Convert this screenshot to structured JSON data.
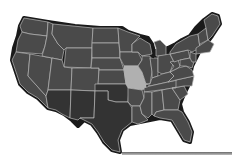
{
  "map": {
    "title": "United States",
    "colors": {
      "default_fill": "#4a4a4a",
      "highlight_fill": "#b0b0b0",
      "southwest_fill": "#333333",
      "border": "#b8b8b8",
      "outline": "#1a1a1a",
      "background": "#ffffff"
    },
    "highlighted_state": "Missouri",
    "dark_region_states": [
      "Arizona",
      "New Mexico",
      "Texas",
      "Oklahoma"
    ]
  }
}
